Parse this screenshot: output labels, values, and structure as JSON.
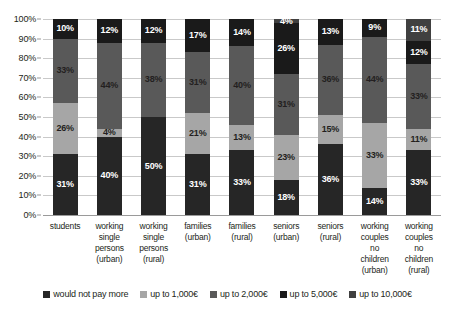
{
  "chart_data": {
    "type": "bar",
    "subtype": "stacked-percentage-column",
    "title": "",
    "subtitle": "",
    "xlabel": "",
    "ylabel": "",
    "ylim": [
      0,
      100
    ],
    "grid": true,
    "legend_position": "bottom",
    "y_ticks": [
      "0%",
      "10%",
      "20%",
      "30%",
      "40%",
      "50%",
      "60%",
      "70%",
      "80%",
      "90%",
      "100%"
    ],
    "y_tick_values": [
      0,
      10,
      20,
      30,
      40,
      50,
      60,
      70,
      80,
      90,
      100
    ],
    "categories": [
      "students",
      "working\nsingle\npersons\n(urban)",
      "working\nsingle\npersons\n(rural)",
      "families\n(urban)",
      "families\n(rural)",
      "seniors\n(urban)",
      "seniors\n(rural)",
      "working\ncouples\nno\nchildren\n(urban)",
      "working\ncouples\nno\nchildren\n(rural)"
    ],
    "series": [
      {
        "name": "would not pay more",
        "color": "#262626",
        "label_color": "#ffffff",
        "values": [
          31,
          40,
          50,
          31,
          33,
          18,
          36,
          14,
          33
        ],
        "labels": [
          "31%",
          "40%",
          "50%",
          "31%",
          "33%",
          "18%",
          "36%",
          "14%",
          "33%"
        ]
      },
      {
        "name": "up to 1,000€",
        "color": "#a6a6a6",
        "label_color": "#231f20",
        "values": [
          26,
          4,
          0,
          21,
          13,
          23,
          15,
          33,
          11
        ],
        "labels": [
          "26%",
          "4%",
          "",
          "21%",
          "13%",
          "23%",
          "15%",
          "33%",
          "11%"
        ]
      },
      {
        "name": "up to 2,000€",
        "color": "#595959",
        "label_color": "#231f20",
        "values": [
          33,
          44,
          38,
          31,
          40,
          31,
          36,
          44,
          33
        ],
        "labels": [
          "33%",
          "44%",
          "38%",
          "31%",
          "40%",
          "31%",
          "36%",
          "44%",
          "33%"
        ]
      },
      {
        "name": "up to 5,000€",
        "color": "#1a1a1a",
        "label_color": "#ffffff",
        "values": [
          10,
          12,
          12,
          17,
          14,
          26,
          13,
          9,
          12
        ],
        "labels": [
          "10%",
          "12%",
          "12%",
          "17%",
          "14%",
          "26%",
          "13%",
          "9%",
          "12%"
        ]
      },
      {
        "name": "up to 10,000€",
        "color": "#404040",
        "label_color": "#ffffff",
        "values": [
          0,
          0,
          0,
          0,
          0,
          2,
          0,
          0,
          11
        ],
        "labels": [
          "",
          "",
          "",
          "",
          "",
          "4%",
          "",
          "",
          "11%"
        ]
      }
    ]
  },
  "legend": {
    "items": [
      {
        "label": "would not pay more",
        "color": "#262626"
      },
      {
        "label": "up to 1,000€",
        "color": "#a6a6a6"
      },
      {
        "label": "up to 2,000€",
        "color": "#595959"
      },
      {
        "label": "up to 5,000€",
        "color": "#1a1a1a"
      },
      {
        "label": "up to 10,000€",
        "color": "#404040"
      }
    ]
  }
}
